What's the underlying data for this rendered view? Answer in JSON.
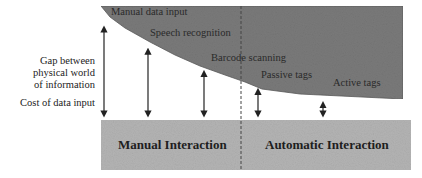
{
  "diagram": {
    "left_labels": {
      "gap": [
        "Gap between",
        "physical world",
        "of information"
      ],
      "cost": "Cost of data input"
    },
    "methods": [
      {
        "label": "Manual data input",
        "relative_gap": 1.0
      },
      {
        "label": "Speech recognition",
        "relative_gap": 0.75
      },
      {
        "label": "Barcode scanning",
        "relative_gap": 0.5
      },
      {
        "label": "Passive tags",
        "relative_gap": 0.3
      },
      {
        "label": "Active tags",
        "relative_gap": 0.15
      }
    ],
    "bands": {
      "manual": "Manual Interaction",
      "automatic": "Automatic Interaction"
    },
    "colors": {
      "shape_fill": "#7a7a7a",
      "band_fill": "#b8b8b8",
      "arrow": "#222222",
      "text": "#222222"
    }
  }
}
